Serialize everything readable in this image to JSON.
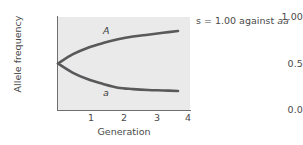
{
  "chart_data": {
    "type": "line",
    "title": "",
    "subtitle": "",
    "xlabel": "Generation",
    "ylabel": "Allele frequency",
    "xlim": [
      0,
      4.4
    ],
    "ylim": [
      0.0,
      1.0
    ],
    "xticks": [
      1,
      2,
      3,
      4
    ],
    "xticklabels": [
      "1",
      "2",
      "3",
      "4"
    ],
    "yticks": [
      0.0,
      0.5,
      1.0
    ],
    "yticklabels": [
      "0.0",
      "0.5",
      "1.00"
    ],
    "grid": false,
    "legend": "inline-curve-labels",
    "plot_background": "#eaeaea",
    "line_color": "#59595b",
    "x": [
      0,
      0.5,
      1,
      1.5,
      2,
      2.5,
      3,
      3.5,
      4
    ],
    "series": [
      {
        "name": "A",
        "label": "A",
        "values": [
          0.5,
          0.6,
          0.67,
          0.72,
          0.76,
          0.79,
          0.81,
          0.83,
          0.85
        ]
      },
      {
        "name": "a",
        "label": "a",
        "values": [
          0.5,
          0.4,
          0.33,
          0.28,
          0.24,
          0.225,
          0.215,
          0.21,
          0.205
        ]
      }
    ],
    "annotations": [
      {
        "name": "selection-coefficient",
        "text_plain": "s = 1.00 against aa",
        "text_prefix": "s = 1.00 against ",
        "text_italic": "aa"
      }
    ]
  },
  "axes": {
    "y": {
      "title": "Allele frequency",
      "tick_top": "1.00",
      "tick_mid": "0.5",
      "tick_bottom": "0.0"
    },
    "x": {
      "title": "Generation",
      "tick_1": "1",
      "tick_2": "2",
      "tick_3": "3",
      "tick_4": "4"
    }
  },
  "series_labels": {
    "upper": "A",
    "lower": "a"
  },
  "annotation": {
    "prefix": "s = 1.00 against ",
    "italic": "aa"
  }
}
